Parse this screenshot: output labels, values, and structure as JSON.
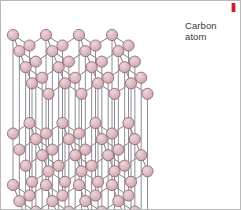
{
  "figure": {
    "annotations": [
      {
        "name": "carbon-atom-label",
        "text": "Carbon\natom",
        "x": 184,
        "y": 19,
        "color": "#3a3a3a"
      }
    ],
    "corner_mark": {
      "name": "red-mark",
      "color": "#c0232a"
    },
    "border_color": "#b9b9b9",
    "background": "#ffffff"
  },
  "style": {
    "atom_fill": "#d9b5bb",
    "atom_fill_light": "#e8d2d6",
    "atom_stroke": "#8d5f68",
    "atom_radius": 5.6,
    "bond_color": "#6f6f78",
    "bond_width": 0.9,
    "pillar_color": "#8c8c96",
    "pillar_width": 1.0
  },
  "chart_data": {
    "type": "diagram",
    "stacking": "AB A (hexagonal sheets)",
    "layers": [
      {
        "name": "top-layer",
        "y_offset": 0,
        "atom_count": 22
      },
      {
        "name": "middle-layer",
        "y_offset": 88,
        "atom_count": 22
      },
      {
        "name": "bottom-layer",
        "y_offset": 150,
        "atom_count": 22
      }
    ],
    "geometry": {
      "origin_x": 12,
      "origin_y": 34,
      "cell_width": 33,
      "cell_height": 17,
      "skew_x": 19,
      "skew_y": -19,
      "rows": 3,
      "cols": 3
    }
  }
}
